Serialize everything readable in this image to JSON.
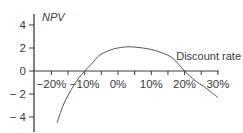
{
  "chart_data": {
    "type": "line",
    "title": "",
    "xlabel": "Discount rate",
    "ylabel": "NPV",
    "x_unit": "%",
    "xlim": [
      -25,
      30
    ],
    "ylim": [
      -5,
      5
    ],
    "grid": false,
    "legend": null,
    "x_ticks": [
      -20,
      -10,
      0,
      10,
      20,
      30
    ],
    "x_tick_labels": [
      "−20%",
      "−10%",
      "0%",
      "10%",
      "20%",
      "30%"
    ],
    "x_minor_step": 5,
    "y_ticks": [
      4,
      2,
      0,
      -2,
      -4
    ],
    "y_tick_labels": [
      "4",
      "2",
      "0",
      "− 2",
      "− 4"
    ],
    "series": [
      {
        "name": "NPV",
        "color": "#555555",
        "x": [
          -18.3,
          -16.5,
          -14,
          -12,
          -10,
          -8,
          -5.4,
          -2,
          0,
          3,
          6,
          9.6,
          13,
          16.5,
          20,
          23,
          26,
          30
        ],
        "y": [
          -4.5,
          -3.0,
          -1.6,
          -0.7,
          0.0,
          0.6,
          1.4,
          1.85,
          2.0,
          2.1,
          2.05,
          1.9,
          1.6,
          1.1,
          0.0,
          -0.8,
          -1.4,
          -2.3
        ]
      }
    ]
  },
  "colors": {
    "axis": "#3a3a3a",
    "curve": "#555555",
    "text": "#3a3a3a",
    "background": "#ffffff"
  }
}
